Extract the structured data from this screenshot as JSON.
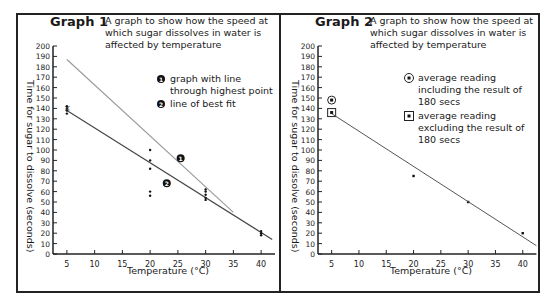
{
  "graphs": [
    {
      "title": "Graph 1",
      "description": "A graph to show how the speed at which sugar dissolves in water is affected by temperature",
      "legend": [
        {
          "marker": "1",
          "label": "graph with line through highest point"
        },
        {
          "marker": "2",
          "label": "line of best fit"
        }
      ],
      "ylabel": "Time for sugar to dissolve (seconds)",
      "xlabel": "Temperature (°C)"
    },
    {
      "title": "Graph 2",
      "description": "A graph to show how the speed at which sugar dissolves in water is affected by temperature",
      "legend": [
        {
          "marker": "circle",
          "label": "average reading including the result of 180 secs"
        },
        {
          "marker": "square",
          "label": "average reading excluding the result of 180 secs"
        }
      ],
      "ylabel": "Time for sugar to dissolve (seconds)",
      "xlabel": "Temperature (°C)"
    }
  ],
  "chart_data": [
    {
      "type": "scatter",
      "title": "Graph 1",
      "subtitle": "A graph to show how the speed at which sugar dissolves in water is affected by temperature",
      "xlabel": "Temperature (°C)",
      "ylabel": "Time for sugar to dissolve (seconds)",
      "xticks": [
        5,
        10,
        15,
        20,
        25,
        30,
        35,
        40
      ],
      "yticks": [
        0,
        10,
        20,
        30,
        40,
        50,
        60,
        70,
        80,
        90,
        100,
        110,
        120,
        130,
        140,
        150,
        160,
        170,
        180,
        190,
        200
      ],
      "xlim": [
        2.5,
        42.5
      ],
      "ylim": [
        0,
        200
      ],
      "grid": false,
      "points": [
        {
          "x": 5,
          "y": 142
        },
        {
          "x": 5,
          "y": 140
        },
        {
          "x": 5,
          "y": 138
        },
        {
          "x": 5,
          "y": 135
        },
        {
          "x": 20,
          "y": 100
        },
        {
          "x": 20,
          "y": 90
        },
        {
          "x": 20,
          "y": 82
        },
        {
          "x": 20,
          "y": 60
        },
        {
          "x": 20,
          "y": 56
        },
        {
          "x": 30,
          "y": 62
        },
        {
          "x": 30,
          "y": 60
        },
        {
          "x": 30,
          "y": 57
        },
        {
          "x": 30,
          "y": 54
        },
        {
          "x": 30,
          "y": 52
        },
        {
          "x": 40,
          "y": 22
        },
        {
          "x": 40,
          "y": 20
        },
        {
          "x": 40,
          "y": 18
        }
      ],
      "series": [
        {
          "name": "graph with line through highest point",
          "marker": "1",
          "type": "line",
          "x": [
            5,
            35
          ],
          "y": [
            187,
            40
          ],
          "color": "#9a9a9a"
        },
        {
          "name": "line of best fit",
          "marker": "2",
          "type": "line",
          "x": [
            5,
            42
          ],
          "y": [
            138,
            14
          ],
          "color": "#444444"
        }
      ],
      "annotations": [
        {
          "label": "1",
          "x": 25.5,
          "y": 92
        },
        {
          "label": "2",
          "x": 23,
          "y": 68
        }
      ]
    },
    {
      "type": "scatter",
      "title": "Graph 2",
      "subtitle": "A graph to show how the speed at which sugar dissolves in water is affected by temperature",
      "xlabel": "Temperature (°C)",
      "ylabel": "Time for sugar to dissolve (seconds)",
      "xticks": [
        5,
        10,
        15,
        20,
        25,
        30,
        35,
        40
      ],
      "yticks": [
        0,
        10,
        20,
        30,
        40,
        50,
        60,
        70,
        80,
        90,
        100,
        110,
        120,
        130,
        140,
        150,
        160,
        170,
        180,
        190,
        200
      ],
      "xlim": [
        2.5,
        42.5
      ],
      "ylim": [
        0,
        200
      ],
      "grid": false,
      "series": [
        {
          "name": "average reading including the result of 180 secs",
          "marker": "circle",
          "x": [
            5
          ],
          "y": [
            148
          ]
        },
        {
          "name": "average reading excluding the result of 180 secs",
          "marker": "square",
          "x": [
            5
          ],
          "y": [
            136
          ]
        },
        {
          "name": "readings",
          "marker": "dot",
          "x": [
            20,
            30,
            40
          ],
          "y": [
            75,
            50,
            20
          ]
        },
        {
          "name": "line of best fit",
          "type": "line",
          "x": [
            5,
            42.5
          ],
          "y": [
            135,
            8
          ],
          "color": "#555555"
        }
      ]
    }
  ]
}
